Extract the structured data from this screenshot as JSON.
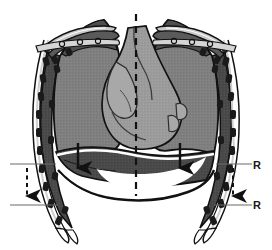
{
  "figure": {
    "view": "anterior coronal section",
    "background_color": "#ffffff"
  },
  "palette": {
    "outline": "#111111",
    "lung_fill": "#808080",
    "pleura_band": "#4a4a4a",
    "heart_fill": "#9a9a9a",
    "heart_light": "#b0b0b0",
    "diaphragm_fill": "#4a4a4a",
    "rib_fill": "#f2f2f2",
    "rib_segment": "#1a1a1a",
    "clavicle_fill": "#c9c9c9",
    "air_space": "#ffffff",
    "reference_line": "#6b6b6b",
    "arrow_color": "#111111",
    "midline_color": "#111111"
  },
  "structures": {
    "midline": {
      "name": "vertical dashed midline",
      "style": "dashed"
    },
    "ribcage_left": {
      "name": "left rib cage",
      "rib_count": 10
    },
    "ribcage_right": {
      "name": "right rib cage",
      "rib_count": 10
    },
    "clavicle_left": {
      "name": "left clavicle"
    },
    "clavicle_right": {
      "name": "right clavicle"
    },
    "lung_left": {
      "name": "left lung field"
    },
    "lung_right": {
      "name": "right lung field"
    },
    "heart": {
      "name": "heart and mediastinum"
    },
    "diaphragm": {
      "name": "diaphragm dome"
    }
  },
  "annotations": {
    "diaphragm_arrows": [
      {
        "id": "arrow-diaphragm-left",
        "direction": "down",
        "style": "solid"
      },
      {
        "id": "arrow-diaphragm-right",
        "direction": "down",
        "style": "solid"
      }
    ],
    "excursion_arrows": [
      {
        "id": "arrow-excursion-left",
        "direction": "down",
        "style": "dashed"
      },
      {
        "id": "arrow-excursion-right",
        "direction": "down",
        "style": "dashed"
      }
    ],
    "reference_lines": [
      {
        "id": "ref-line-left-upper",
        "side": "left",
        "position": "upper"
      },
      {
        "id": "ref-line-left-lower",
        "side": "left",
        "position": "lower"
      },
      {
        "id": "ref-line-right-upper",
        "side": "right",
        "position": "upper"
      },
      {
        "id": "ref-line-right-lower",
        "side": "right",
        "position": "lower"
      }
    ]
  },
  "labels": {
    "r_upper": "R",
    "r_lower": "R"
  }
}
